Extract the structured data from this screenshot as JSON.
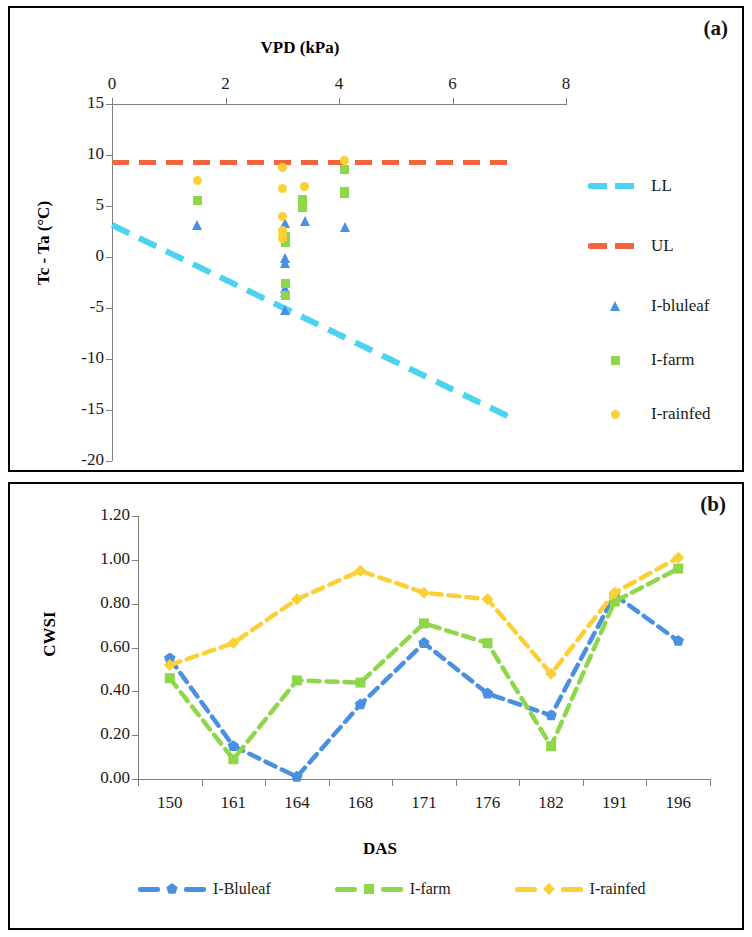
{
  "figure": {
    "panel_a_tag": "(a)",
    "panel_b_tag": "(b)"
  },
  "colors": {
    "ll_cyan": "#4bd3ef",
    "ul_orange": "#f4653f",
    "blue": "#4a90e2",
    "green": "#8ed64a",
    "yellow": "#fbd036",
    "axis": "#808080",
    "text": "#1a1a1a"
  },
  "panel_a": {
    "x_axis_title": "VPD (kPa)",
    "y_axis_title": "Tc - Ta (°C)",
    "x_ticks": [
      "0",
      "2",
      "4",
      "6",
      "8"
    ],
    "y_ticks": [
      "15",
      "10",
      "5",
      "0",
      "-5",
      "-10",
      "-15",
      "-20"
    ],
    "x_range": [
      0,
      8
    ],
    "y_range": [
      -20,
      15
    ],
    "legend": [
      {
        "label": "LL",
        "marker": "dashed-line",
        "color": "#4bd3ef"
      },
      {
        "label": "UL",
        "marker": "dashed-line",
        "color": "#f4653f"
      },
      {
        "label": "I-bluleaf",
        "marker": "triangle",
        "color": "#4a90e2"
      },
      {
        "label": "I-farm",
        "marker": "square",
        "color": "#8ed64a"
      },
      {
        "label": "I-rainfed",
        "marker": "circle",
        "color": "#fbd036"
      }
    ]
  },
  "panel_b": {
    "x_axis_title": "DAS",
    "y_axis_title": "CWSI",
    "y_ticks": [
      "0.00",
      "0.20",
      "0.40",
      "0.60",
      "0.80",
      "1.00",
      "1.20"
    ],
    "legend": [
      {
        "label": "I-Bluleaf",
        "color": "#4a90e2",
        "marker": "pentagon"
      },
      {
        "label": "I-farm",
        "color": "#8ed64a",
        "marker": "square"
      },
      {
        "label": "I-rainfed",
        "color": "#fbd036",
        "marker": "diamond"
      }
    ]
  },
  "chart_data": [
    {
      "type": "scatter",
      "panel": "(a)",
      "title": "",
      "xlabel": "VPD (kPa)",
      "ylabel": "Tc - Ta (°C)",
      "xlim": [
        0,
        8
      ],
      "ylim": [
        -20,
        15
      ],
      "x_axis_position": "top",
      "xticks": [
        0,
        2,
        4,
        6,
        8
      ],
      "yticks": [
        15,
        10,
        5,
        0,
        -5,
        -10,
        -15,
        -20
      ],
      "grid": false,
      "legend_position": "right",
      "reference_lines": [
        {
          "name": "UL",
          "type": "horizontal-dashed",
          "color": "#f4653f",
          "y": 9.3,
          "x_from": 0,
          "x_to": 7.0
        },
        {
          "name": "LL",
          "type": "sloped-dashed",
          "color": "#4bd3ef",
          "x_from": 0,
          "y_from": 3.1,
          "x_to": 7.0,
          "y_to": -15.7
        }
      ],
      "series": [
        {
          "name": "I-bluleaf",
          "marker": "triangle",
          "color": "#4a90e2",
          "points": [
            [
              1.5,
              3.1
            ],
            [
              3.05,
              3.3
            ],
            [
              3.05,
              -0.1
            ],
            [
              3.05,
              -0.6
            ],
            [
              3.05,
              -3.0
            ],
            [
              3.05,
              -3.4
            ],
            [
              3.05,
              -5.2
            ],
            [
              3.4,
              3.5
            ],
            [
              4.1,
              2.9
            ]
          ]
        },
        {
          "name": "I-farm",
          "marker": "square",
          "color": "#8ed64a",
          "points": [
            [
              1.5,
              5.5
            ],
            [
              3.05,
              2.0
            ],
            [
              3.05,
              1.5
            ],
            [
              3.05,
              1.4
            ],
            [
              3.05,
              -2.6
            ],
            [
              3.05,
              -3.8
            ],
            [
              3.35,
              4.9
            ],
            [
              3.35,
              5.6
            ],
            [
              4.1,
              8.6
            ],
            [
              4.1,
              6.2
            ],
            [
              4.1,
              6.4
            ]
          ]
        },
        {
          "name": "I-rainfed",
          "marker": "circle",
          "color": "#fbd036",
          "points": [
            [
              1.5,
              7.5
            ],
            [
              3.0,
              8.8
            ],
            [
              3.0,
              6.7
            ],
            [
              3.0,
              4.0
            ],
            [
              3.0,
              2.6
            ],
            [
              3.0,
              2.0
            ],
            [
              3.0,
              1.8
            ],
            [
              3.4,
              6.9
            ],
            [
              4.1,
              9.5
            ]
          ]
        }
      ]
    },
    {
      "type": "line",
      "panel": "(b)",
      "title": "",
      "xlabel": "DAS",
      "ylabel": "CWSI",
      "categories": [
        "150",
        "161",
        "164",
        "168",
        "171",
        "176",
        "182",
        "191",
        "196"
      ],
      "ylim": [
        0.0,
        1.2
      ],
      "yticks": [
        0.0,
        0.2,
        0.4,
        0.6,
        0.8,
        1.0,
        1.2
      ],
      "grid": false,
      "legend_position": "bottom",
      "line_style": "dashed",
      "series": [
        {
          "name": "I-Bluleaf",
          "color": "#4a90e2",
          "marker": "pentagon",
          "values": [
            0.55,
            0.15,
            0.01,
            0.34,
            0.62,
            0.39,
            0.29,
            0.84,
            0.63
          ]
        },
        {
          "name": "I-farm",
          "color": "#8ed64a",
          "marker": "square",
          "values": [
            0.46,
            0.09,
            0.45,
            0.44,
            0.71,
            0.62,
            0.15,
            0.81,
            0.96
          ]
        },
        {
          "name": "I-rainfed",
          "color": "#fbd036",
          "marker": "diamond",
          "values": [
            0.52,
            0.62,
            0.82,
            0.95,
            0.85,
            0.82,
            0.48,
            0.85,
            1.01
          ]
        }
      ]
    }
  ]
}
